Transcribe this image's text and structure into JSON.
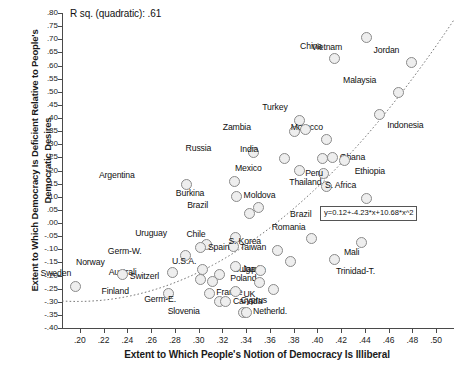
{
  "chart_data": {
    "type": "scatter",
    "title": "",
    "xlabel": "Extent to Which People's Notion of Democracy Is Illiberal",
    "ylabel": "Extent to Which Democracy Is Deficient Relative to People's Democratic Desires",
    "xlim": [
      0.185,
      0.515
    ],
    "ylim": [
      -0.4,
      0.8
    ],
    "grid": false,
    "legend": null,
    "annotations": {
      "rsq": "R sq. (quadratic): .61",
      "equation": "y=0.12+-4.23*x+10.68*x^2",
      "equation_point_label": "Brazil"
    },
    "xticks": [
      ".20",
      ".22",
      ".24",
      ".26",
      ".28",
      ".30",
      ".32",
      ".34",
      ".36",
      ".38",
      ".40",
      ".42",
      ".44",
      ".46",
      ".48",
      ".50"
    ],
    "xtick_values": [
      0.2,
      0.22,
      0.24,
      0.26,
      0.28,
      0.3,
      0.32,
      0.34,
      0.36,
      0.38,
      0.4,
      0.42,
      0.44,
      0.46,
      0.48,
      0.5
    ],
    "yticks": [
      ".80",
      ".75",
      ".70",
      ".65",
      ".60",
      ".55",
      ".50",
      ".45",
      ".40",
      ".35",
      ".30",
      ".25",
      ".20",
      ".15",
      ".10",
      ".05",
      ".00",
      "-.05",
      "-.10",
      "-.15",
      "-.20",
      "-.25",
      "-.30",
      "-.35",
      "-.40"
    ],
    "ytick_values": [
      0.8,
      0.75,
      0.7,
      0.65,
      0.6,
      0.55,
      0.5,
      0.45,
      0.4,
      0.35,
      0.3,
      0.25,
      0.2,
      0.15,
      0.1,
      0.05,
      0.0,
      -0.05,
      -0.1,
      -0.15,
      -0.2,
      -0.25,
      -0.3,
      -0.35,
      -0.4
    ],
    "fit": {
      "type": "quadratic",
      "intercept": 0.12,
      "b1": -4.23,
      "b2": 10.68,
      "style": "dotted"
    },
    "points": [
      {
        "label": "Vietnam",
        "x": 0.441,
        "y": 0.705,
        "lx": -24,
        "ly": 9
      },
      {
        "label": "China",
        "x": 0.414,
        "y": 0.625,
        "lx": -12,
        "ly": -13
      },
      {
        "label": "Jordan",
        "x": 0.479,
        "y": 0.61,
        "lx": -12,
        "ly": -13
      },
      {
        "label": "Malaysia",
        "x": 0.468,
        "y": 0.497,
        "lx": -22,
        "ly": -13
      },
      {
        "label": "Indonesia",
        "x": 0.452,
        "y": 0.412,
        "lx": 8,
        "ly": 10
      },
      {
        "label": "Turkey",
        "x": 0.385,
        "y": 0.392,
        "lx": -12,
        "ly": -13
      },
      {
        "label": "Zambia",
        "x": 0.381,
        "y": 0.348,
        "lx": -44,
        "ly": -5
      },
      {
        "label": "Morocco",
        "x": 0.408,
        "y": 0.318,
        "lx": -4,
        "ly": -13
      },
      {
        "label": "Russia",
        "x": 0.346,
        "y": 0.268,
        "lx": -42,
        "ly": -5
      },
      {
        "label": "India",
        "x": 0.372,
        "y": 0.245,
        "lx": -26,
        "ly": -10
      },
      {
        "label": "Ghana",
        "x": 0.413,
        "y": 0.25,
        "lx": 7,
        "ly": 0
      },
      {
        "label": "Ethiopia",
        "x": 0.423,
        "y": 0.24,
        "lx": 10,
        "ly": 11
      },
      {
        "label": "Mexico",
        "x": 0.385,
        "y": 0.2,
        "lx": -38,
        "ly": -3
      },
      {
        "label": "Thailand",
        "x": 0.405,
        "y": 0.19,
        "lx": -2,
        "ly": 9
      },
      {
        "label": "Burkina",
        "x": 0.33,
        "y": 0.16,
        "lx": -30,
        "ly": 12
      },
      {
        "label": "Peru",
        "x": 0.408,
        "y": 0.14,
        "lx": -4,
        "ly": -13
      },
      {
        "label": "Argentina",
        "x": 0.29,
        "y": 0.145,
        "lx": -52,
        "ly": -10
      },
      {
        "label": "Moldova",
        "x": 0.332,
        "y": 0.1,
        "lx": 7,
        "ly": -2
      },
      {
        "label": "S. Africa",
        "x": 0.441,
        "y": 0.095,
        "lx": -10,
        "ly": -13
      },
      {
        "label": "Brazil",
        "x": 0.35,
        "y": 0.06,
        "lx": -50,
        "ly": -2
      },
      {
        "label": "Chile",
        "x": 0.331,
        "y": -0.055,
        "lx": -30,
        "ly": -3
      },
      {
        "label": "Romania",
        "x": 0.395,
        "y": -0.058,
        "lx": -6,
        "ly": -11
      },
      {
        "label": "Mali",
        "x": 0.437,
        "y": -0.075,
        "lx": -2,
        "ly": 9
      },
      {
        "label": "Taiwan",
        "x": 0.329,
        "y": -0.09,
        "lx": 7,
        "ly": 0
      },
      {
        "label": "Uruguay",
        "x": 0.307,
        "y": -0.082,
        "lx": -40,
        "ly": -12
      },
      {
        "label": "Spain",
        "x": 0.302,
        "y": -0.095,
        "lx": 7,
        "ly": -1
      },
      {
        "label": "S. Korea",
        "x": 0.366,
        "y": -0.105,
        "lx": -16,
        "ly": -10
      },
      {
        "label": "Germ-W.",
        "x": 0.289,
        "y": -0.125,
        "lx": -44,
        "ly": -5
      },
      {
        "label": "Bulgaria",
        "x": 0.377,
        "y": -0.145,
        "lx": -26,
        "ly": 8
      },
      {
        "label": "Trinidad-T.",
        "x": 0.414,
        "y": -0.138,
        "lx": 2,
        "ly": 12
      },
      {
        "label": "Japan",
        "x": 0.331,
        "y": -0.165,
        "lx": 7,
        "ly": 3
      },
      {
        "label": "Australi",
        "x": 0.278,
        "y": -0.188,
        "lx": -36,
        "ly": 0
      },
      {
        "label": "U.S.A.",
        "x": 0.303,
        "y": -0.178,
        "lx": -6,
        "ly": -9
      },
      {
        "label": "Poland",
        "x": 0.352,
        "y": -0.18,
        "lx": -4,
        "ly": 8
      },
      {
        "label": "Norway",
        "x": 0.236,
        "y": -0.198,
        "lx": -18,
        "ly": -13
      },
      {
        "label": "Switzerl",
        "x": 0.302,
        "y": -0.215,
        "lx": -42,
        "ly": -3
      },
      {
        "label": "UK",
        "x": 0.351,
        "y": -0.225,
        "lx": -4,
        "ly": 12
      },
      {
        "label": "Sweden",
        "x": 0.196,
        "y": -0.24,
        "lx": -4,
        "ly": -13
      },
      {
        "label": "Finland",
        "x": 0.275,
        "y": -0.268,
        "lx": -40,
        "ly": -2
      },
      {
        "label": "France",
        "x": 0.309,
        "y": -0.268,
        "lx": 7,
        "ly": -1
      },
      {
        "label": "Cyprus",
        "x": 0.331,
        "y": -0.26,
        "lx": 5,
        "ly": 9
      },
      {
        "label": "Germ-E.",
        "x": 0.318,
        "y": -0.298,
        "lx": -44,
        "ly": -2
      },
      {
        "label": "Canada",
        "x": 0.323,
        "y": -0.3,
        "lx": 7,
        "ly": -1
      },
      {
        "label": "Slovenia",
        "x": 0.338,
        "y": -0.34,
        "lx": -44,
        "ly": -1
      },
      {
        "label": "Netherld.",
        "x": 0.34,
        "y": -0.34,
        "lx": 7,
        "ly": -1
      },
      {
        "label": "",
        "x": 0.363,
        "y": -0.255,
        "lx": 0,
        "ly": 0
      },
      {
        "label": "",
        "x": 0.318,
        "y": -0.195,
        "lx": 0,
        "ly": 0
      },
      {
        "label": "",
        "x": 0.312,
        "y": -0.222,
        "lx": 0,
        "ly": 0
      },
      {
        "label": "",
        "x": 0.343,
        "y": 0.035,
        "lx": 0,
        "ly": 0
      },
      {
        "label": "",
        "x": 0.39,
        "y": 0.355,
        "lx": 0,
        "ly": 0
      },
      {
        "label": "",
        "x": 0.404,
        "y": 0.245,
        "lx": 0,
        "ly": 0
      }
    ]
  }
}
